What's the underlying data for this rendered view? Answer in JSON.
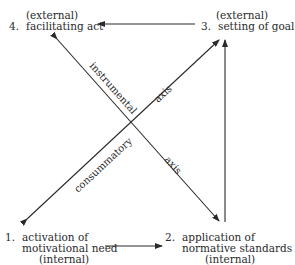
{
  "nodes": {
    "n4": {
      "qualifier": "(external)",
      "number": "4.",
      "label": "facilitating act"
    },
    "n3": {
      "qualifier": "(external)",
      "number": "3.",
      "label": "setting of goal"
    },
    "n1": {
      "number": "1.",
      "line1": "activation of",
      "line2": "motivational need",
      "qualifier": "(internal)"
    },
    "n2": {
      "number": "2.",
      "line1": "application of",
      "line2": "normative standards",
      "qualifier": "(internal)"
    }
  },
  "axes": {
    "instrumental": {
      "word1": "instrumental",
      "word2": "axis"
    },
    "consummatory": {
      "word1": "consummatory",
      "word2": "axis"
    }
  },
  "colors": {
    "line": "#2a2a2a",
    "background": "#ffffff"
  }
}
